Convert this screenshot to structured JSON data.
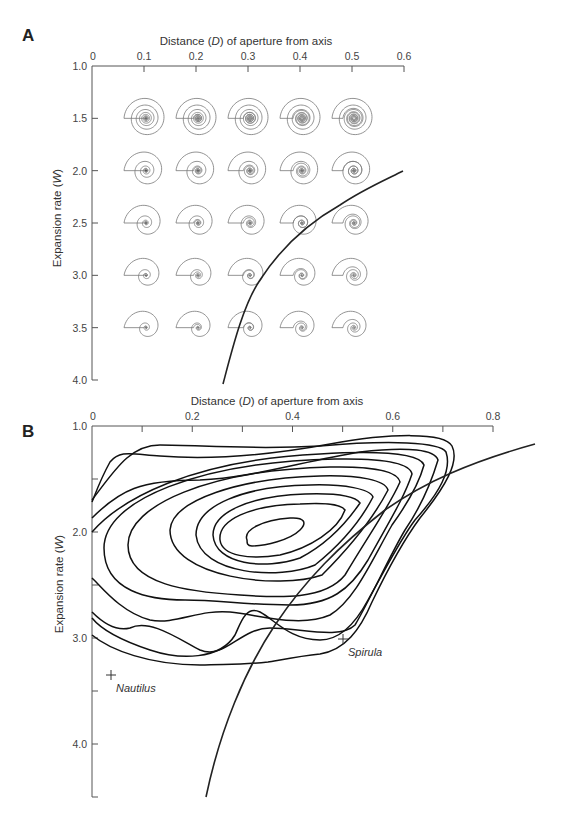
{
  "figure": {
    "panel_a": {
      "letter": "A",
      "x_title": "Distance (D) of aperture from axis",
      "x_title_parts": [
        "Distance (",
        "D",
        ") of aperture from axis"
      ],
      "y_title": "Expansion rate (W)",
      "y_title_parts": [
        "Expansion rate (",
        "W",
        ")"
      ],
      "x_ticks": [
        "0",
        "0.1",
        "0.2",
        "0.3",
        "0.4",
        "0.5",
        "0.6"
      ],
      "y_ticks": [
        "1.0",
        "1.5",
        "2.0",
        "2.5",
        "3.0",
        "3.5",
        "4.0"
      ]
    },
    "panel_b": {
      "letter": "B",
      "x_title_parts": [
        "Distance (",
        "D",
        ") of aperture from axis"
      ],
      "y_title_parts": [
        "Expansion rate (",
        "W",
        ")"
      ],
      "x_ticks": [
        "0",
        "0.2",
        "0.4",
        "0.6",
        "0.8"
      ],
      "y_ticks": [
        "1.0",
        "2.0",
        "3.0",
        "4.0"
      ],
      "labels": {
        "nautilus": "Nautilus",
        "spirula": "Spirula"
      }
    }
  },
  "chart_data": [
    {
      "type": "scatter",
      "title": "A",
      "description": "Grid of theoretical coiled shell morphologies (Raup shell-coiling morphospace) with a curve separating coiled shells whose whorls overlap from those that do not.",
      "xlabel": "Distance (D) of aperture from axis",
      "ylabel": "Expansion rate (W)",
      "xlim": [
        0,
        0.6
      ],
      "ylim": [
        4.0,
        1.0
      ],
      "y_inverted": true,
      "x_ticks": [
        0,
        0.1,
        0.2,
        0.3,
        0.4,
        0.5,
        0.6
      ],
      "y_ticks": [
        1.0,
        1.5,
        2.0,
        2.5,
        3.0,
        3.5,
        4.0
      ],
      "grid": false,
      "shell_grid": {
        "D": [
          0.1,
          0.2,
          0.3,
          0.4,
          0.5
        ],
        "W": [
          1.5,
          2.0,
          2.5,
          3.0,
          3.5
        ]
      },
      "boundary_curve": {
        "name": "D = 1/W",
        "points": [
          [
            0.27,
            3.85
          ],
          [
            0.29,
            3.45
          ],
          [
            0.33,
            3.0
          ],
          [
            0.4,
            2.5
          ],
          [
            0.5,
            2.0
          ],
          [
            0.59,
            1.7
          ]
        ]
      }
    },
    {
      "type": "contour",
      "title": "B",
      "description": "Frequency contours of ammonoid species in W-D morphospace, with the D = 1/W boundary curve.",
      "xlabel": "Distance (D) of aperture from axis",
      "ylabel": "Expansion rate (W)",
      "xlim": [
        0,
        0.8
      ],
      "ylim": [
        4.5,
        1.0
      ],
      "y_inverted": true,
      "x_ticks": [
        0,
        0.1,
        0.2,
        0.3,
        0.4,
        0.5,
        0.6,
        0.7,
        0.8
      ],
      "x_tick_labels": [
        "0",
        "0.2",
        "0.4",
        "0.6",
        "0.8"
      ],
      "y_ticks": [
        1.0,
        1.5,
        2.0,
        2.5,
        3.0,
        3.5,
        4.0,
        4.5
      ],
      "y_tick_labels": [
        "1.0",
        "2.0",
        "3.0",
        "4.0"
      ],
      "grid": false,
      "contour_count": 11,
      "density_peak": {
        "D": 0.35,
        "W": 2.05
      },
      "annotations": [
        {
          "label": "Nautilus",
          "D": 0.03,
          "W": 3.35
        },
        {
          "label": "Spirula",
          "D": 0.48,
          "W": 3.0
        }
      ],
      "boundary_curve": {
        "name": "D = 1/W",
        "points": [
          [
            0.27,
            4.5
          ],
          [
            0.3,
            3.5
          ],
          [
            0.33,
            3.0
          ],
          [
            0.4,
            2.5
          ],
          [
            0.5,
            2.0
          ],
          [
            0.6,
            1.65
          ],
          [
            0.7,
            1.42
          ],
          [
            0.85,
            1.18
          ]
        ]
      }
    }
  ]
}
